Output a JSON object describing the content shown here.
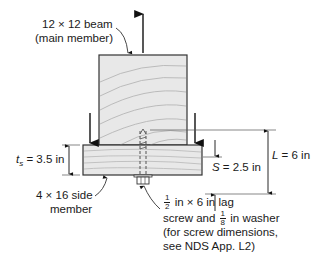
{
  "diagram": {
    "type": "lag screw connection, beam with side member",
    "colors": {
      "wood_fill": "#e6e6e6",
      "grain": "#b8b8b8",
      "outline": "#333333",
      "arrow": "#111111",
      "text": "#1a1a1a"
    },
    "labels": {
      "main_member_line1": "12 × 12 beam",
      "main_member_line2": "(main member)",
      "side_member_line1": "4 × 16 side",
      "side_member_line2": "member",
      "ts_symbol": "t",
      "ts_subscript": "s",
      "ts_value": " = 3.5 in",
      "S_symbol": "S",
      "S_value": " = 2.5 in",
      "L_symbol": "L",
      "L_value": " = 6 in",
      "screw_frac1_num": "1",
      "screw_frac1_den": "2",
      "screw_line1_rest": " in × 6 in lag",
      "screw_line2_pre": "screw and ",
      "screw_frac2_num": "1",
      "screw_frac2_den": "8",
      "screw_line2_rest": " in washer",
      "screw_line3": "(for screw dimensions,",
      "screw_line4": "see NDS App. L2)"
    },
    "loads": {
      "up_arrow": "tension on main member",
      "down_arrows": [
        "left bearing load",
        "right bearing load"
      ]
    }
  }
}
